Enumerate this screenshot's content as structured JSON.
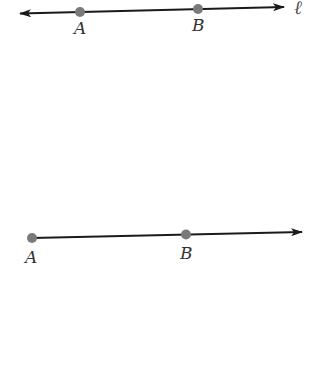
{
  "figures": [
    {
      "kind": "line",
      "name": "line-l",
      "line_label": "ℓ",
      "points": [
        {
          "label": "A",
          "x": 80,
          "y": 12
        },
        {
          "label": "B",
          "x": 198,
          "y": 9
        }
      ],
      "start": {
        "x": 20,
        "y": 13.5
      },
      "end": {
        "x": 284,
        "y": 7
      },
      "arrows": [
        "start",
        "end"
      ]
    },
    {
      "kind": "ray",
      "name": "ray-ab",
      "points": [
        {
          "label": "A",
          "x": 32,
          "y": 238
        },
        {
          "label": "B",
          "x": 186,
          "y": 234.5
        }
      ],
      "start": {
        "x": 32,
        "y": 238
      },
      "end": {
        "x": 302,
        "y": 232
      },
      "arrows": [
        "end"
      ]
    }
  ],
  "colors": {
    "line": "#1a1a1a",
    "point": "#7a7a7a",
    "label": "#333333"
  }
}
